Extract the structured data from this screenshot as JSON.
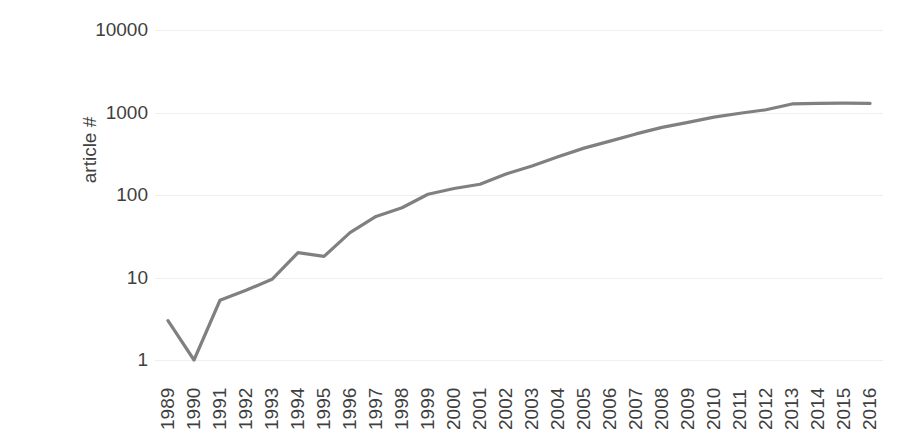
{
  "chart_data": {
    "type": "line",
    "title": "",
    "subtitle": "",
    "xlabel": "",
    "ylabel": "article #",
    "yscale": "log",
    "ylim": [
      1,
      10000
    ],
    "ytick_labels": [
      "10000",
      "1000",
      "100",
      "10",
      "1"
    ],
    "yticks": [
      10000,
      1000,
      100,
      10,
      1
    ],
    "grid": true,
    "legend": false,
    "legend_position": "none",
    "line_color": "#808080",
    "categories": [
      "1989",
      "1990",
      "1991",
      "1992",
      "1993",
      "1994",
      "1995",
      "1996",
      "1997",
      "1998",
      "1999",
      "2000",
      "2001",
      "2002",
      "2003",
      "2004",
      "2005",
      "2006",
      "2007",
      "2008",
      "2009",
      "2010",
      "2011",
      "2012",
      "2013",
      "2014",
      "2015",
      "2016"
    ],
    "values": [
      3,
      1,
      5.3,
      7,
      9.5,
      20,
      18,
      35,
      55,
      70,
      102,
      120,
      135,
      180,
      225,
      290,
      370,
      450,
      550,
      660,
      760,
      880,
      980,
      1080,
      1270,
      1290,
      1300,
      1290
    ],
    "series": [
      {
        "name": "article #",
        "color": "#808080",
        "values": [
          3,
          1,
          5.3,
          7,
          9.5,
          20,
          18,
          35,
          55,
          70,
          102,
          120,
          135,
          180,
          225,
          290,
          370,
          450,
          550,
          660,
          760,
          880,
          980,
          1080,
          1270,
          1290,
          1300,
          1290
        ]
      }
    ]
  }
}
